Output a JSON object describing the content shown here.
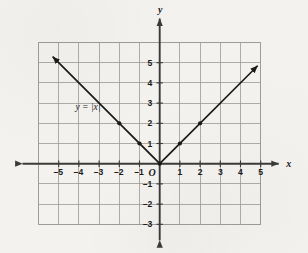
{
  "figure": {
    "background_color": "#f4f2ef",
    "grid_color": "#9a9a9a",
    "axis_color": "#3a3a3a",
    "curve_color": "#1a1a1a",
    "label_color": "#1a1a1a"
  },
  "axis_labels": {
    "x_axis_name": "x",
    "y_axis_name": "y",
    "origin_label": "O"
  },
  "equation_label": {
    "text": "y = |x|",
    "x": -3.55,
    "y": 2.65
  },
  "chart_data": {
    "type": "line",
    "title": "",
    "subtitle": "",
    "xlabel": "x",
    "ylabel": "y",
    "xlim": [
      -6,
      5
    ],
    "ylim": [
      -3,
      6
    ],
    "grid": true,
    "legend": "none",
    "annotations": [
      "y = |x|"
    ],
    "x_tick_labels": [
      "–5",
      "–4",
      "–3",
      "–2",
      "–1",
      "1",
      "2",
      "3",
      "4",
      "5"
    ],
    "x_ticks": [
      -5,
      -4,
      -3,
      -2,
      -1,
      1,
      2,
      3,
      4,
      5
    ],
    "y_tick_labels": [
      "5",
      "4",
      "3",
      "2",
      "1",
      "–1",
      "–2",
      "–3"
    ],
    "y_ticks": [
      5,
      4,
      3,
      2,
      1,
      -1,
      -2,
      -3
    ],
    "series": [
      {
        "name": "y = |x|",
        "equation": "y = |x|",
        "x": [
          -5.3,
          -4,
          -3,
          -2,
          -1,
          0,
          1,
          2,
          3,
          4,
          4.85
        ],
        "values": [
          5.3,
          4,
          3,
          2,
          1,
          0,
          1,
          2,
          3,
          4,
          4.85
        ],
        "marked_points": [
          {
            "x": -2,
            "y": 2
          },
          {
            "x": -1,
            "y": 1
          },
          {
            "x": 0,
            "y": 0
          },
          {
            "x": 1,
            "y": 1
          },
          {
            "x": 2,
            "y": 2
          }
        ],
        "arrow_ends": [
          "left",
          "right"
        ]
      }
    ]
  }
}
